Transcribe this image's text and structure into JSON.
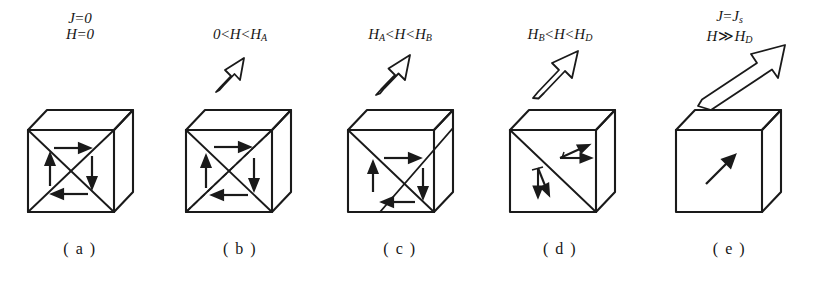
{
  "figure": {
    "type": "diagram",
    "background_color": "#ffffff",
    "line_color": "#1a1a1a",
    "panels": [
      {
        "key": "a",
        "label": "( a )",
        "condition_line1_html": "<i>J</i><span class=\"op\">=</span>0",
        "condition_line2_html": "<i>H</i><span class=\"op\">=</span>0",
        "condition_text": "J = 0, H = 0",
        "field_arrow": "none",
        "domain_pattern": "symmetric-cross-four-domains",
        "arrows": [
          "right",
          "up",
          "down",
          "left"
        ]
      },
      {
        "key": "b",
        "label": "( b )",
        "condition_line1_html": "0<span class=\"op\">&lt;</span><i>H</i><span class=\"op\">&lt;</span><i>H</i><sub>A</sub>",
        "condition_line2_html": "",
        "condition_text": "0 < H < H_A",
        "field_arrow": "small-up-right",
        "domain_pattern": "cross-shifted-with-dashed-original-wall",
        "arrows": [
          "right",
          "up",
          "down",
          "left"
        ]
      },
      {
        "key": "c",
        "label": "( c )",
        "condition_line1_html": "<i>H</i><sub>A</sub><span class=\"op\">&lt;</span><i>H</i><span class=\"op\">&lt;</span><i>H</i><sub>B</sub>",
        "condition_line2_html": "",
        "condition_text": "H_A < H < H_B",
        "field_arrow": "medium-up-right",
        "domain_pattern": "cross-shifted-further",
        "arrows": [
          "right",
          "up",
          "down",
          "left"
        ]
      },
      {
        "key": "d",
        "label": "( d )",
        "condition_line1_html": "<i>H</i><sub>B</sub><span class=\"op\">&lt;</span><i>H</i><span class=\"op\">&lt;</span><i>H</i><sub>D</sub>",
        "condition_line2_html": "",
        "condition_text": "H_B < H < H_D",
        "field_arrow": "large-up-right",
        "domain_pattern": "single-diagonal-wall-two-domains",
        "arrows": [
          "rotating-pair-upper-right",
          "rotating-pair-lower-left"
        ]
      },
      {
        "key": "e",
        "label": "( e )",
        "condition_line1_html": "<i>J</i><span class=\"op\">=</span><i>J</i><sub>s</sub>",
        "condition_line2_html": "<i>H</i><span class=\"op\">&#8811;</span><i>H</i><sub>D</sub>",
        "condition_text": "J = J_s, H >> H_D",
        "field_arrow": "extra-large-up-right",
        "domain_pattern": "saturated-single-domain",
        "arrows": [
          "diagonal-up-right"
        ]
      }
    ]
  }
}
